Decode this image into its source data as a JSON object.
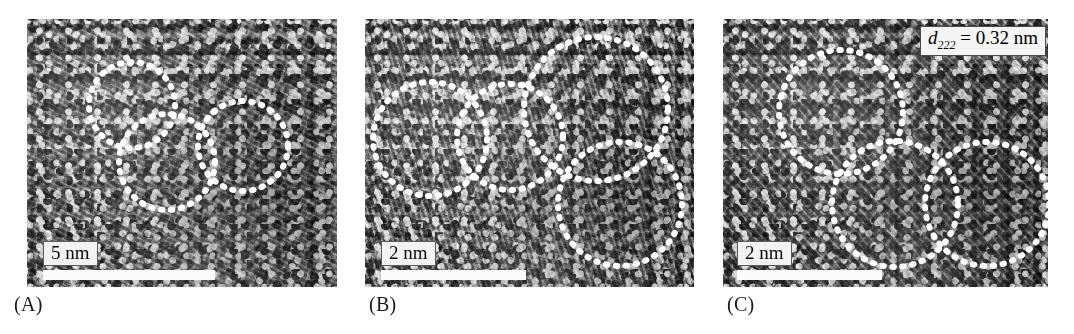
{
  "figure": {
    "type": "hrtem-micrograph-panels",
    "background_color": "#ffffff",
    "panel_count": 3
  },
  "panels": [
    {
      "id": "A",
      "caption": "(A)",
      "scalebar": {
        "label": "5 nm",
        "value": 5,
        "unit": "nm"
      },
      "annotation": null,
      "particle_outline_style": "dotted-circle",
      "particle_count": 3,
      "particles": [
        {
          "cx": 105,
          "cy": 86,
          "r": 43
        },
        {
          "cx": 140,
          "cy": 143,
          "r": 48
        },
        {
          "cx": 216,
          "cy": 127,
          "r": 45
        }
      ]
    },
    {
      "id": "B",
      "caption": "(B)",
      "scalebar": {
        "label": "2 nm",
        "value": 2,
        "unit": "nm"
      },
      "annotation": null,
      "particle_outline_style": "dotted-circle",
      "particle_count": 4,
      "particles": [
        {
          "cx": 65,
          "cy": 120,
          "r": 57
        },
        {
          "cx": 145,
          "cy": 118,
          "r": 53
        },
        {
          "cx": 231,
          "cy": 90,
          "r": 72
        },
        {
          "cx": 255,
          "cy": 185,
          "r": 62
        }
      ]
    },
    {
      "id": "C",
      "caption": "(C)",
      "scalebar": {
        "label": "2 nm",
        "value": 2,
        "unit": "nm"
      },
      "annotation": {
        "symbol": "d",
        "subscript": "222",
        "equals": "=",
        "value": "0.32",
        "unit": "nm",
        "full_text": "d222 = 0.32 nm"
      },
      "particle_outline_style": "dotted-circle",
      "particle_count": 3,
      "particles": [
        {
          "cx": 118,
          "cy": 93,
          "r": 62
        },
        {
          "cx": 172,
          "cy": 185,
          "r": 63
        },
        {
          "cx": 264,
          "cy": 185,
          "r": 62
        }
      ]
    }
  ],
  "colors": {
    "dot_overlay": "#ffffff",
    "scalebar_bar": "#fbfbfb",
    "scalebar_label_bg": "#f2f2f2",
    "annotation_bg": "#f4f4f4",
    "caption_text": "#1a1a1a",
    "page_background": "#ffffff"
  }
}
